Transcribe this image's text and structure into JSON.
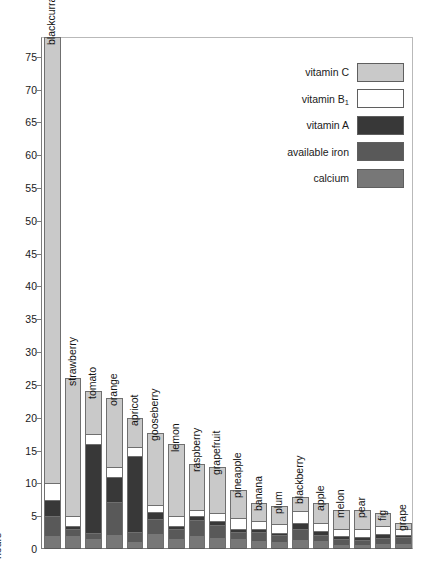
{
  "chart_data": {
    "type": "bar",
    "subtype": "stacked-bar",
    "title": "",
    "xlabel": "",
    "ylabel": "hours",
    "ylim": [
      0,
      78
    ],
    "ytick_step": 5,
    "yticks": [
      0,
      5,
      10,
      15,
      20,
      25,
      30,
      35,
      40,
      45,
      50,
      55,
      60,
      65,
      70,
      75
    ],
    "grid": false,
    "legend_position": "top-right",
    "series": [
      {
        "name": "vitamin C",
        "color": "#c9c9c9",
        "values": [
          68.0,
          21.0,
          6.5,
          10.5,
          4.5,
          11.0,
          11.0,
          7.0,
          7.0,
          4.3,
          2.8,
          2.7,
          2.2,
          3.0,
          3.0,
          3.0,
          2.0,
          1.0
        ]
      },
      {
        "name": "vitamin B1",
        "color": "#ffffff",
        "values": [
          2.5,
          1.6,
          1.5,
          1.6,
          1.3,
          1.0,
          1.5,
          1.0,
          1.3,
          1.6,
          1.2,
          1.3,
          1.8,
          1.2,
          1.0,
          1.1,
          1.2,
          0.8
        ]
      },
      {
        "name": "vitamin A",
        "color": "#383838",
        "values": [
          2.5,
          0.5,
          13.5,
          3.8,
          11.6,
          1.1,
          0.4,
          0.6,
          0.5,
          0.5,
          0.4,
          0.4,
          1.0,
          0.6,
          0.4,
          0.5,
          0.6,
          0.4
        ]
      },
      {
        "name": "available iron",
        "color": "#595959",
        "values": [
          3.0,
          1.0,
          1.0,
          5.0,
          1.5,
          2.3,
          1.6,
          2.4,
          2.0,
          1.1,
          1.4,
          1.0,
          1.6,
          1.0,
          1.0,
          0.8,
          1.0,
          1.0
        ]
      },
      {
        "name": "calcium",
        "color": "#777777",
        "values": [
          2.0,
          2.0,
          1.5,
          2.1,
          1.1,
          2.3,
          1.5,
          2.0,
          1.7,
          1.5,
          1.2,
          1.1,
          1.4,
          1.2,
          0.6,
          0.6,
          0.7,
          0.8
        ]
      }
    ],
    "categories": [
      "blackcurrant",
      "strawberry",
      "tomato",
      "orange",
      "apricot",
      "gooseberry",
      "lemon",
      "raspberry",
      "grapefruit",
      "pineapple",
      "banana",
      "plum",
      "blackberry",
      "apple",
      "melon",
      "pear",
      "fig",
      "grape"
    ],
    "totals": [
      78.0,
      26.1,
      24.0,
      23.0,
      20.0,
      17.7,
      16.0,
      13.0,
      12.5,
      9.0,
      7.0,
      6.5,
      8.0,
      7.0,
      6.0,
      6.0,
      5.5,
      4.0
    ]
  },
  "legend": {
    "items": [
      {
        "label": "vitamin C",
        "sub": "",
        "color": "#c9c9c9"
      },
      {
        "label": "vitamin B",
        "sub": "1",
        "color": "#ffffff"
      },
      {
        "label": "vitamin A",
        "sub": "",
        "color": "#383838"
      },
      {
        "label": "available iron",
        "sub": "",
        "color": "#595959"
      },
      {
        "label": "calcium",
        "sub": "",
        "color": "#777777"
      }
    ]
  }
}
